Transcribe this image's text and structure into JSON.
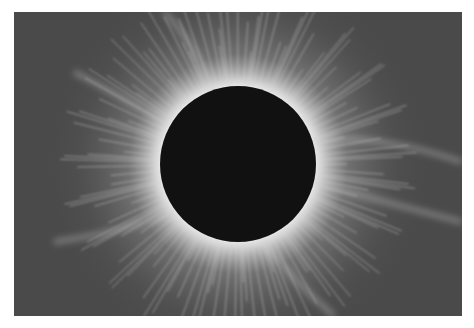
{
  "image": {
    "subject": "total solar eclipse with corona",
    "colors": {
      "background": "#ffffff",
      "sky": "#4a4a4a",
      "moon": "#111111",
      "corona": "#f2f2f2"
    },
    "moon": {
      "cx": 224,
      "cy": 152,
      "r": 78
    }
  }
}
